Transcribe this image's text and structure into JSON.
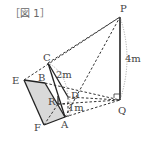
{
  "figure": {
    "title": "［図 1］",
    "points": {
      "P": "P",
      "Q": "Q",
      "A": "A",
      "B": "B",
      "C": "C",
      "D": "D",
      "E": "E",
      "F": "F",
      "R": "R"
    },
    "measurements": {
      "PQ": "4m",
      "CD": "2m",
      "RA": "1m"
    },
    "colors": {
      "line": "#222222",
      "dashed": "#333333",
      "fill": "#d8d8d8",
      "label": "#444444"
    }
  }
}
